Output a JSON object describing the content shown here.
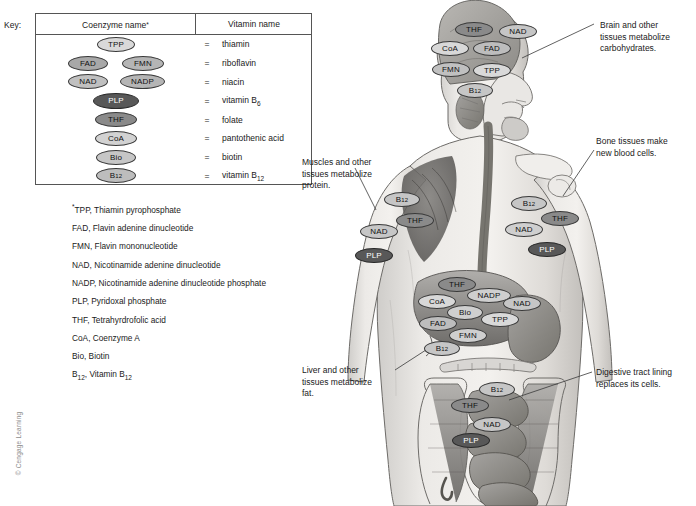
{
  "key": {
    "label": "Key:",
    "col_coenzyme": "Coenzyme name",
    "col_coenzyme_sup": "*",
    "col_vitamin": "Vitamin name",
    "equals": "=",
    "rows": [
      {
        "vitamin": "thiamin",
        "vitamin_sub": "",
        "coenzymes": [
          {
            "abbr": "TPP",
            "sub": "",
            "shade": "#d9d9d9",
            "dark": false,
            "w": 38,
            "h": 15,
            "x": 61
          }
        ]
      },
      {
        "vitamin": "riboflavin",
        "vitamin_sub": "",
        "coenzymes": [
          {
            "abbr": "FAD",
            "sub": "",
            "shade": "#a8a8a8",
            "dark": false,
            "w": 40,
            "h": 15,
            "x": 32
          },
          {
            "abbr": "FMN",
            "sub": "",
            "shade": "#b5b5b5",
            "dark": false,
            "w": 42,
            "h": 15,
            "x": 86
          }
        ]
      },
      {
        "vitamin": "niacin",
        "vitamin_sub": "",
        "coenzymes": [
          {
            "abbr": "NAD",
            "sub": "",
            "shade": "#c0c0c0",
            "dark": false,
            "w": 40,
            "h": 15,
            "x": 32
          },
          {
            "abbr": "NADP",
            "sub": "",
            "shade": "#b5b5b5",
            "dark": false,
            "w": 45,
            "h": 15,
            "x": 84
          }
        ]
      },
      {
        "vitamin": "vitamin B",
        "vitamin_sub": "6",
        "coenzymes": [
          {
            "abbr": "PLP",
            "sub": "",
            "shade": "#585858",
            "dark": true,
            "w": 46,
            "h": 16,
            "x": 57
          }
        ]
      },
      {
        "vitamin": "folate",
        "vitamin_sub": "",
        "coenzymes": [
          {
            "abbr": "THF",
            "sub": "",
            "shade": "#8a8a8a",
            "dark": false,
            "w": 42,
            "h": 15,
            "x": 59
          }
        ]
      },
      {
        "vitamin": "pantothenic acid",
        "vitamin_sub": "",
        "coenzymes": [
          {
            "abbr": "CoA",
            "sub": "",
            "shade": "#d2d2d2",
            "dark": false,
            "w": 42,
            "h": 15,
            "x": 59
          }
        ]
      },
      {
        "vitamin": "biotin",
        "vitamin_sub": "",
        "coenzymes": [
          {
            "abbr": "Bio",
            "sub": "",
            "shade": "#c6c6c6",
            "dark": false,
            "w": 40,
            "h": 15,
            "x": 60
          }
        ]
      },
      {
        "vitamin": "vitamin B",
        "vitamin_sub": "12",
        "coenzymes": [
          {
            "abbr": "B",
            "sub": "12",
            "shade": "#bdbdbd",
            "dark": false,
            "w": 40,
            "h": 15,
            "x": 60
          }
        ]
      }
    ]
  },
  "abbreviations": [
    {
      "sup": "*",
      "abbr": "TPP",
      "sub": "",
      "name": "Thiamin pyrophosphate"
    },
    {
      "sup": "",
      "abbr": "FAD",
      "sub": "",
      "name": "Flavin adenine dinucleotide"
    },
    {
      "sup": "",
      "abbr": "FMN",
      "sub": "",
      "name": "Flavin mononucleotide"
    },
    {
      "sup": "",
      "abbr": "NAD",
      "sub": "",
      "name": "Nicotinamide adenine dinucleotide"
    },
    {
      "sup": "",
      "abbr": "NADP",
      "sub": "",
      "name": "Nicotinamide adenine dinucleotide phosphate"
    },
    {
      "sup": "",
      "abbr": "PLP",
      "sub": "",
      "name": "Pyridoxal phosphate"
    },
    {
      "sup": "",
      "abbr": "THF",
      "sub": "",
      "name": "Tetrahyrdrofolic acid"
    },
    {
      "sup": "",
      "abbr": "CoA",
      "sub": "",
      "name": "Coenzyme A"
    },
    {
      "sup": "",
      "abbr": "Bio",
      "sub": "",
      "name": "Biotin"
    },
    {
      "sup": "",
      "abbr": "B",
      "sub": "12",
      "name": "Vitamin B",
      "name_sub": "12"
    }
  ],
  "captions": [
    {
      "id": "brain",
      "text": "Brain and other\ntissues metabolize\ncarbohydrates.",
      "x": 600,
      "y": 20,
      "w": 96
    },
    {
      "id": "bone",
      "text": "Bone tissues make\nnew blood cells.",
      "x": 596,
      "y": 136,
      "w": 100
    },
    {
      "id": "muscle",
      "text": "Muscles and other\ntissues metabolize\nprotein.",
      "x": 302,
      "y": 157,
      "w": 96
    },
    {
      "id": "liver",
      "text": "Liver and other\ntissues metabolize\nfat.",
      "x": 302,
      "y": 365,
      "w": 96
    },
    {
      "id": "digestive",
      "text": "Digestive tract lining\nreplaces its cells.",
      "x": 596,
      "y": 367,
      "w": 100
    }
  ],
  "leaders": [
    {
      "id": "brain-leader",
      "x1": 594,
      "y1": 24,
      "x2": 522,
      "y2": 58
    },
    {
      "id": "bone-leader",
      "x1": 594,
      "y1": 150,
      "x2": 563,
      "y2": 196
    },
    {
      "id": "muscle-leader",
      "x1": 355,
      "y1": 168,
      "x2": 376,
      "y2": 210
    },
    {
      "id": "liver-leader",
      "x1": 395,
      "y1": 370,
      "x2": 429,
      "y2": 348
    },
    {
      "id": "digestive-leader",
      "x1": 592,
      "y1": 372,
      "x2": 509,
      "y2": 400
    }
  ],
  "body_tags": {
    "brain": [
      {
        "abbr": "THF",
        "sub": "",
        "shade": "#8a8a8a",
        "dark": false,
        "x": 455,
        "y": 22,
        "w": 38,
        "h": 15
      },
      {
        "abbr": "NAD",
        "sub": "",
        "shade": "#c6c6c6",
        "dark": false,
        "x": 499,
        "y": 24,
        "w": 38,
        "h": 15
      },
      {
        "abbr": "CoA",
        "sub": "",
        "shade": "#d8d8d8",
        "dark": false,
        "x": 431,
        "y": 41,
        "w": 38,
        "h": 15
      },
      {
        "abbr": "FAD",
        "sub": "",
        "shade": "#bdbdbd",
        "dark": false,
        "x": 473,
        "y": 41,
        "w": 38,
        "h": 15
      },
      {
        "abbr": "FMN",
        "sub": "",
        "shade": "#c0c0c0",
        "dark": false,
        "x": 432,
        "y": 62,
        "w": 38,
        "h": 15
      },
      {
        "abbr": "TPP",
        "sub": "",
        "shade": "#d9d9d9",
        "dark": false,
        "x": 473,
        "y": 63,
        "w": 38,
        "h": 15
      },
      {
        "abbr": "B",
        "sub": "12",
        "shade": "#c6c6c6",
        "dark": false,
        "x": 457,
        "y": 83,
        "w": 36,
        "h": 15
      }
    ],
    "muscle": [
      {
        "abbr": "B",
        "sub": "12",
        "shade": "#c6c6c6",
        "dark": false,
        "x": 384,
        "y": 192,
        "w": 36,
        "h": 15
      },
      {
        "abbr": "THF",
        "sub": "",
        "shade": "#8a8a8a",
        "dark": false,
        "x": 396,
        "y": 213,
        "w": 38,
        "h": 15
      },
      {
        "abbr": "NAD",
        "sub": "",
        "shade": "#c6c6c6",
        "dark": false,
        "x": 360,
        "y": 224,
        "w": 38,
        "h": 15
      },
      {
        "abbr": "PLP",
        "sub": "",
        "shade": "#585858",
        "dark": true,
        "x": 355,
        "y": 248,
        "w": 38,
        "h": 15
      }
    ],
    "bone": [
      {
        "abbr": "B",
        "sub": "12",
        "shade": "#c6c6c6",
        "dark": false,
        "x": 511,
        "y": 196,
        "w": 36,
        "h": 15
      },
      {
        "abbr": "THF",
        "sub": "",
        "shade": "#8a8a8a",
        "dark": false,
        "x": 541,
        "y": 211,
        "w": 38,
        "h": 15
      },
      {
        "abbr": "NAD",
        "sub": "",
        "shade": "#cfcfcf",
        "dark": false,
        "x": 505,
        "y": 222,
        "w": 38,
        "h": 15
      },
      {
        "abbr": "PLP",
        "sub": "",
        "shade": "#585858",
        "dark": true,
        "x": 528,
        "y": 242,
        "w": 38,
        "h": 15
      }
    ],
    "liver": [
      {
        "abbr": "THF",
        "sub": "",
        "shade": "#8a8a8a",
        "dark": false,
        "x": 438,
        "y": 277,
        "w": 38,
        "h": 15
      },
      {
        "abbr": "NADP",
        "sub": "",
        "shade": "#cfcfcf",
        "dark": false,
        "x": 467,
        "y": 288,
        "w": 44,
        "h": 15
      },
      {
        "abbr": "NAD",
        "sub": "",
        "shade": "#c6c6c6",
        "dark": false,
        "x": 503,
        "y": 296,
        "w": 38,
        "h": 15
      },
      {
        "abbr": "CoA",
        "sub": "",
        "shade": "#d8d8d8",
        "dark": false,
        "x": 418,
        "y": 294,
        "w": 38,
        "h": 15
      },
      {
        "abbr": "Bio",
        "sub": "",
        "shade": "#cfcfcf",
        "dark": false,
        "x": 447,
        "y": 305,
        "w": 36,
        "h": 15
      },
      {
        "abbr": "TPP",
        "sub": "",
        "shade": "#d9d9d9",
        "dark": false,
        "x": 481,
        "y": 312,
        "w": 38,
        "h": 15
      },
      {
        "abbr": "FAD",
        "sub": "",
        "shade": "#bdbdbd",
        "dark": false,
        "x": 419,
        "y": 316,
        "w": 38,
        "h": 15
      },
      {
        "abbr": "FMN",
        "sub": "",
        "shade": "#cfcfcf",
        "dark": false,
        "x": 449,
        "y": 328,
        "w": 38,
        "h": 15
      },
      {
        "abbr": "B",
        "sub": "12",
        "shade": "#c6c6c6",
        "dark": false,
        "x": 424,
        "y": 341,
        "w": 36,
        "h": 15
      }
    ],
    "digestive": [
      {
        "abbr": "B",
        "sub": "12",
        "shade": "#c6c6c6",
        "dark": false,
        "x": 479,
        "y": 382,
        "w": 36,
        "h": 15
      },
      {
        "abbr": "THF",
        "sub": "",
        "shade": "#8a8a8a",
        "dark": false,
        "x": 451,
        "y": 398,
        "w": 38,
        "h": 15
      },
      {
        "abbr": "NAD",
        "sub": "",
        "shade": "#c6c6c6",
        "dark": false,
        "x": 473,
        "y": 417,
        "w": 38,
        "h": 15
      },
      {
        "abbr": "PLP",
        "sub": "",
        "shade": "#585858",
        "dark": true,
        "x": 452,
        "y": 433,
        "w": 38,
        "h": 15
      }
    ]
  },
  "copyright": "© Cengage Learning",
  "colors": {
    "body_fill": "#e3e1df",
    "organ_fill": "#9a9a9a",
    "outline": "#5a5a5a",
    "table_border": "#555555",
    "text": "#1a1a1a"
  }
}
